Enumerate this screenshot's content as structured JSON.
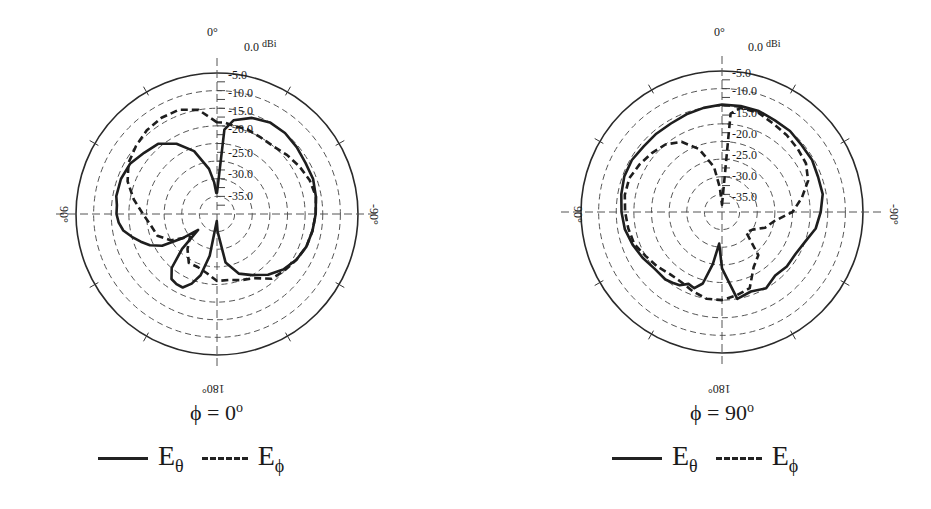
{
  "chart_data": [
    {
      "type": "polar-line",
      "title": "φ = 0°",
      "radial_unit": "dBi",
      "radial_range": [
        -40,
        0
      ],
      "radial_ticks": [
        "0.0",
        "-5.0",
        "-10.0",
        "-15.0",
        "-20.0",
        "-25.0",
        "-30.0",
        "-35.0"
      ],
      "angle_labels": {
        "top": "0°",
        "left": "90°",
        "right": "-90°",
        "bottom": "180°"
      },
      "grid": true,
      "angle_convention": "0° at top, positive counter-clockwise (90° left, -90° right)",
      "series": [
        {
          "name": "Eθ",
          "style": "solid",
          "angles_deg": [
            0,
            -5,
            -10,
            -20,
            -30,
            -40,
            -50,
            -60,
            -70,
            -80,
            -90,
            -100,
            -110,
            -120,
            -130,
            -140,
            -150,
            -160,
            -170,
            -178,
            178,
            170,
            165,
            160,
            155,
            150,
            145,
            140,
            135,
            130,
            125,
            120,
            115,
            110,
            105,
            100,
            95,
            90,
            85,
            80,
            70,
            60,
            50,
            40,
            30,
            20,
            10,
            5,
            2
          ],
          "gain_dbi": [
            -34,
            -16,
            -13,
            -11,
            -10,
            -10,
            -10.5,
            -11,
            -11,
            -11.5,
            -12,
            -12.5,
            -13,
            -14,
            -15.5,
            -17.5,
            -20,
            -22,
            -26,
            -35,
            -38,
            -28,
            -22,
            -19,
            -17,
            -17,
            -17.5,
            -20,
            -26,
            -33,
            -28,
            -22,
            -19,
            -17,
            -15,
            -13,
            -12,
            -11.5,
            -11.5,
            -11,
            -11,
            -11.5,
            -13,
            -14,
            -17,
            -21,
            -27,
            -31,
            -34
          ]
        },
        {
          "name": "Eφ",
          "style": "dashed",
          "angles_deg": [
            0,
            10,
            20,
            30,
            40,
            50,
            60,
            70,
            80,
            90,
            100,
            110,
            120,
            130,
            140,
            150,
            160,
            170,
            180,
            -170,
            -160,
            -150,
            -140,
            -130,
            -120,
            -110,
            -100,
            -90,
            -80,
            -70,
            -60,
            -50,
            -40,
            -30,
            -20,
            -10,
            -5
          ],
          "gain_dbi": [
            -14,
            -10,
            -8.5,
            -8.5,
            -9,
            -10,
            -11,
            -13,
            -16,
            -19,
            -21,
            -22,
            -25,
            -30,
            -27,
            -24,
            -24,
            -23,
            -21,
            -21,
            -20,
            -19,
            -16,
            -15,
            -14,
            -13,
            -12.5,
            -12,
            -11.5,
            -12,
            -13,
            -14,
            -15,
            -15,
            -14.5,
            -14.5,
            -14
          ]
        }
      ]
    },
    {
      "type": "polar-line",
      "title": "φ = 90°",
      "radial_unit": "dBi",
      "radial_range": [
        -40,
        0
      ],
      "radial_ticks": [
        "0.0",
        "-5.0",
        "-10.0",
        "-15.0",
        "-20.0",
        "-25.0",
        "-30.0",
        "-35.0"
      ],
      "angle_labels": {
        "top": "0°",
        "left": "90°",
        "right": "-90°",
        "bottom": "180°"
      },
      "grid": true,
      "angle_convention": "0° at top, positive counter-clockwise (90° left, -90° right)",
      "series": [
        {
          "name": "Eθ",
          "style": "solid",
          "angles_deg": [
            0,
            -10,
            -20,
            -30,
            -40,
            -50,
            -60,
            -70,
            -80,
            -90,
            -100,
            -110,
            -120,
            -130,
            -140,
            -150,
            -160,
            -170,
            180,
            175,
            170,
            165,
            160,
            155,
            150,
            145,
            140,
            130,
            120,
            110,
            100,
            90,
            80,
            70,
            60,
            50,
            40,
            30,
            20,
            10
          ],
          "gain_dbi": [
            -9.5,
            -9.5,
            -9.5,
            -10,
            -10,
            -10.5,
            -10.5,
            -11,
            -11,
            -12,
            -13,
            -15,
            -16,
            -16,
            -16.5,
            -15,
            -16,
            -15,
            -24,
            -31,
            -25,
            -19,
            -17,
            -17.5,
            -16,
            -15.5,
            -15,
            -15,
            -14,
            -13,
            -12,
            -11.5,
            -11,
            -10.5,
            -10.5,
            -11,
            -11,
            -11,
            -10.5,
            -10
          ]
        },
        {
          "name": "Eφ",
          "style": "dashed",
          "angles_deg": [
            0,
            -5,
            -10,
            -20,
            -30,
            -40,
            -50,
            -60,
            -70,
            -80,
            -90,
            -100,
            -110,
            -120,
            -130,
            -140,
            -150,
            -160,
            -170,
            180,
            170,
            160,
            150,
            140,
            130,
            120,
            110,
            100,
            90,
            80,
            70,
            60,
            50,
            40,
            30,
            20,
            10,
            5
          ],
          "gain_dbi": [
            -38,
            -12,
            -10,
            -10,
            -11,
            -11.5,
            -12,
            -12.5,
            -14,
            -17,
            -20,
            -25,
            -27,
            -30,
            -31,
            -24,
            -22,
            -17,
            -16,
            -15,
            -15,
            -16,
            -17,
            -17,
            -16,
            -15,
            -13.5,
            -13,
            -12.5,
            -12,
            -12,
            -13,
            -14,
            -15,
            -17,
            -21,
            -27,
            -33
          ]
        }
      ]
    }
  ],
  "plots": [
    {
      "title_symbol": "ϕ",
      "title_eq": " = 0",
      "title_deg": "o",
      "label_top": "0°",
      "label_left": "90°",
      "label_right": "-90°",
      "label_bottom": "180°",
      "unit": "dBi",
      "ticks": [
        "0.0",
        "-5.0",
        "-10.0",
        "-15.0",
        "-20.0",
        "-25.0",
        "-30.0",
        "-35.0"
      ],
      "legend": {
        "solid_label": "E",
        "solid_sub": "θ",
        "dashed_label": "E",
        "dashed_sub": "ϕ"
      }
    },
    {
      "title_symbol": "ϕ",
      "title_eq": " = 90",
      "title_deg": "o",
      "label_top": "0°",
      "label_left": "90°",
      "label_right": "-90°",
      "label_bottom": "180°",
      "unit": "dBi",
      "ticks": [
        "0.0",
        "-5.0",
        "-10.0",
        "-15.0",
        "-20.0",
        "-25.0",
        "-30.0",
        "-35.0"
      ],
      "legend": {
        "solid_label": "E",
        "solid_sub": "θ",
        "dashed_label": "E",
        "dashed_sub": "ϕ"
      }
    }
  ],
  "colors": {
    "line": "#1e1e1e",
    "grid": "#555555",
    "background": "#ffffff"
  }
}
